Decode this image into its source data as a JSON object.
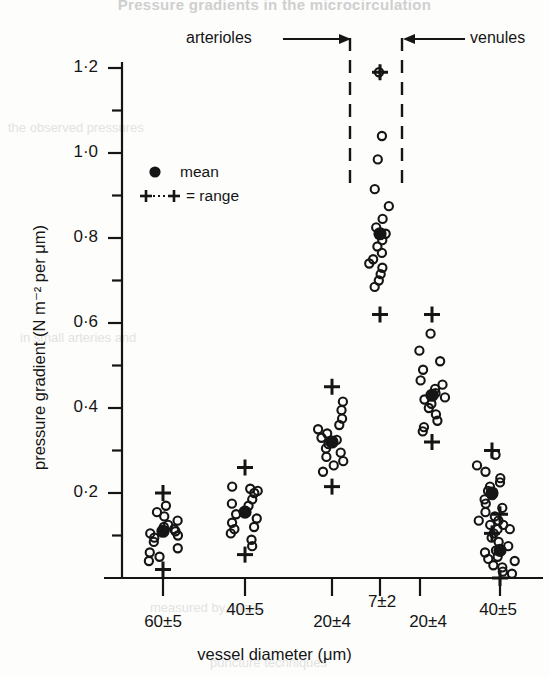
{
  "figure": {
    "title": "Pressure gradients in the microcirculation",
    "watermark_note": "faint scanned page bleed-through"
  },
  "axes": {
    "ylabel": "pressure gradient (N m⁻² per μm)",
    "xlabel": "vessel diameter (μm)",
    "yticks_major": [
      "0·2",
      "0·4",
      "0·6",
      "0·8",
      "1·0",
      "1·2"
    ],
    "ymin": 0,
    "ymax": 1.2,
    "ytick_step": 0.2,
    "yminor_step": 0.1
  },
  "legend": {
    "mean_symbol": "●",
    "mean_label": "mean",
    "range_symbol": "+···+",
    "range_label": "= range"
  },
  "annotations": {
    "arterioles": "arterioles",
    "venules": "venules"
  },
  "chart_data": {
    "type": "scatter",
    "title": "Pressure gradients in the microcirculation",
    "xlabel": "vessel diameter (μm)",
    "ylabel": "pressure gradient (N m⁻² per μm)",
    "ylim": [
      0,
      1.2
    ],
    "grid": false,
    "legend": [
      "mean",
      "range"
    ],
    "legend_position": "upper-left",
    "group_labels": [
      "arterioles",
      "venules"
    ],
    "categories": [
      "60±5",
      "40±5",
      "20±4",
      "7±2",
      "20±4",
      "40±5"
    ],
    "series": [
      {
        "name": "60±5",
        "group": "arterioles",
        "mean": 0.11,
        "range": [
          0.02,
          0.2
        ],
        "points": [
          0.17,
          0.155,
          0.145,
          0.135,
          0.125,
          0.12,
          0.115,
          0.11,
          0.105,
          0.1,
          0.095,
          0.085,
          0.07,
          0.06,
          0.05,
          0.04
        ]
      },
      {
        "name": "40±5",
        "group": "arterioles",
        "mean": 0.155,
        "range": [
          0.055,
          0.26
        ],
        "points": [
          0.215,
          0.21,
          0.205,
          0.2,
          0.185,
          0.175,
          0.17,
          0.155,
          0.15,
          0.14,
          0.13,
          0.12,
          0.115,
          0.105,
          0.09,
          0.075
        ]
      },
      {
        "name": "20±4",
        "group": "arterioles",
        "mean": 0.32,
        "range": [
          0.215,
          0.45
        ],
        "points": [
          0.415,
          0.395,
          0.375,
          0.36,
          0.35,
          0.34,
          0.33,
          0.325,
          0.315,
          0.305,
          0.295,
          0.285,
          0.275,
          0.265,
          0.25
        ]
      },
      {
        "name": "7±2",
        "group": "arterioles",
        "mean": 0.81,
        "range": [
          0.62,
          1.19
        ],
        "points": [
          1.19,
          1.04,
          0.985,
          0.915,
          0.875,
          0.845,
          0.825,
          0.81,
          0.795,
          0.78,
          0.765,
          0.75,
          0.74,
          0.73,
          0.715,
          0.7,
          0.685
        ]
      },
      {
        "name": "20±4",
        "group": "venules",
        "mean": 0.43,
        "range": [
          0.32,
          0.62
        ],
        "points": [
          0.575,
          0.535,
          0.51,
          0.49,
          0.465,
          0.455,
          0.445,
          0.435,
          0.425,
          0.42,
          0.41,
          0.4,
          0.385,
          0.37,
          0.355,
          0.345
        ]
      },
      {
        "name": "40±5",
        "group": "venules",
        "mean": 0.2,
        "range": [
          0.105,
          0.3
        ],
        "points": [
          0.29,
          0.265,
          0.25,
          0.235,
          0.225,
          0.215,
          0.205,
          0.195,
          0.185,
          0.175,
          0.165,
          0.155,
          0.145,
          0.135,
          0.125,
          0.115
        ]
      },
      {
        "name": "tail",
        "group": "venules",
        "mean": 0.065,
        "range": [
          0.0,
          0.15
        ],
        "points": [
          0.135,
          0.125,
          0.115,
          0.105,
          0.095,
          0.085,
          0.075,
          0.065,
          0.06,
          0.05,
          0.045,
          0.04,
          0.03,
          0.025,
          0.015,
          0.01
        ]
      }
    ]
  }
}
